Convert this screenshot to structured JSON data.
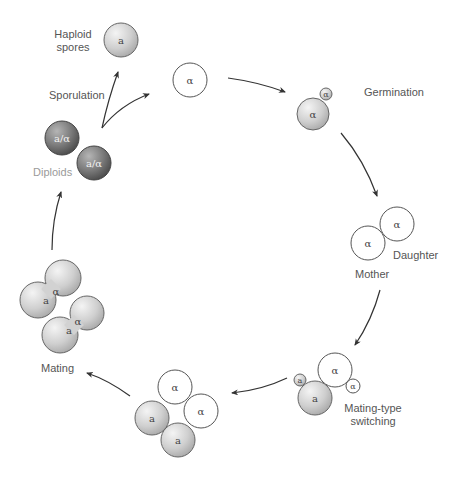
{
  "labels": {
    "haploid_spores_line1": "Haploid",
    "haploid_spores_line2": "spores",
    "sporulation": "Sporulation",
    "diploids": "Diploids",
    "germination": "Germination",
    "daughter": "Daughter",
    "mother": "Mother",
    "mating_type_switching_line1": "Mating-type",
    "mating_type_switching_line2": "switching",
    "mating": "Mating"
  },
  "cell_labels": {
    "a": "a",
    "alpha": "α",
    "diploid": "a/α"
  },
  "colors": {
    "haploid_a_fill": "#c8c8c8",
    "haploid_alpha_fill": "#ffffff",
    "diploid_fill": "#7a7a7a",
    "outline": "#555555",
    "arrow": "#333333",
    "label_text": "#555555",
    "diploid_label": "#9a9a9a"
  },
  "stages": [
    {
      "name": "Haploid spores"
    },
    {
      "name": "Germination"
    },
    {
      "name": "Mother / Daughter"
    },
    {
      "name": "Mating-type switching"
    },
    {
      "name": "Mixed a and α cells"
    },
    {
      "name": "Mating"
    },
    {
      "name": "Diploids"
    },
    {
      "name": "Sporulation"
    }
  ]
}
